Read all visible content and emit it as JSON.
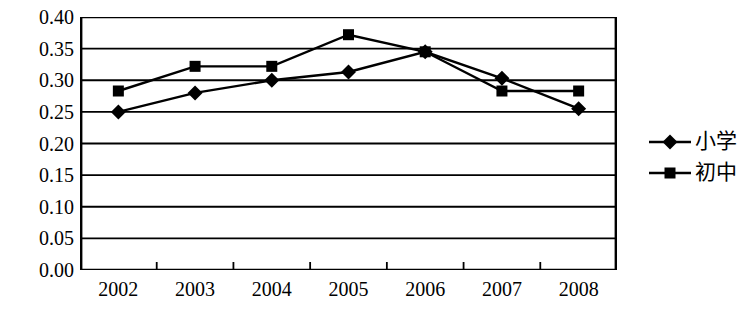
{
  "chart_data": {
    "type": "line",
    "title": "",
    "subtitle": "",
    "xlabel": "",
    "ylabel": "",
    "categories": [
      "2002",
      "2003",
      "2004",
      "2005",
      "2006",
      "2007",
      "2008"
    ],
    "series": [
      {
        "name": "小学",
        "marker": "diamond",
        "values": [
          0.25,
          0.28,
          0.3,
          0.313,
          0.345,
          0.303,
          0.255
        ]
      },
      {
        "name": "初中",
        "marker": "square",
        "values": [
          0.283,
          0.322,
          0.322,
          0.372,
          0.345,
          0.283,
          0.283
        ]
      }
    ],
    "ylim": [
      0.0,
      0.4
    ],
    "ytick_labels": [
      "0.40",
      "0.35",
      "0.30",
      "0.25",
      "0.20",
      "0.15",
      "0.10",
      "0.05",
      "0.00"
    ],
    "ytick_values": [
      0.4,
      0.35,
      0.3,
      0.25,
      0.2,
      0.15,
      0.1,
      0.05,
      0.0
    ],
    "grid": "horizontal",
    "legend_position": "right",
    "line_color": "#000000",
    "marker_color": "#000000",
    "plot_background": "#ffffff",
    "axis_color": "#000000"
  },
  "legend": {
    "entries": [
      {
        "label": "小学",
        "marker": "diamond"
      },
      {
        "label": "初中",
        "marker": "square"
      }
    ]
  }
}
